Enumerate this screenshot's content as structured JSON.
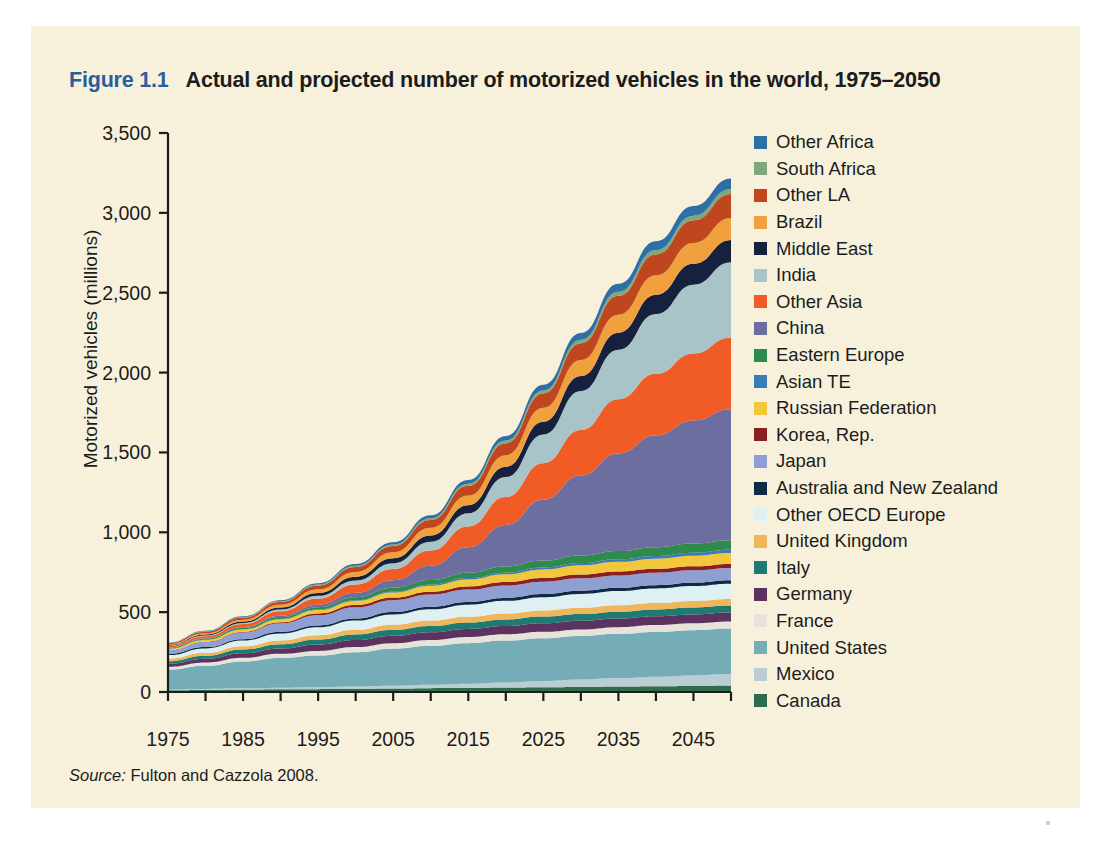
{
  "figure": {
    "number": "Figure 1.1",
    "title": "Actual and projected number of motorized vehicles in the world, 1975–2050",
    "source_word": "Source:",
    "source_text": "Fulton and Cazzola 2008.",
    "number_color": "#2a5d9e",
    "card_color": "#f7f1dc"
  },
  "chart_data": {
    "type": "area",
    "stacked": true,
    "title": "Actual and projected number of motorized vehicles in the world, 1975–2050",
    "xlabel": "",
    "ylabel": "Motorized vehicles (millions)",
    "xlim": [
      1975,
      2050
    ],
    "ylim": [
      0,
      3500
    ],
    "ytick_labels": [
      "0",
      "500",
      "1,000",
      "1,500",
      "2,000",
      "2,500",
      "3,000",
      "3,500"
    ],
    "ytick_values": [
      0,
      500,
      1000,
      1500,
      2000,
      2500,
      3000,
      3500
    ],
    "xtick_labels": [
      "1975",
      "1985",
      "1995",
      "2005",
      "2015",
      "2025",
      "2035",
      "2045"
    ],
    "xtick_values": [
      1975,
      1985,
      1995,
      2005,
      2015,
      2025,
      2035,
      2045
    ],
    "xminor_step": 5,
    "grid": false,
    "legend_position": "right",
    "x": [
      1975,
      1980,
      1985,
      1990,
      1995,
      2000,
      2005,
      2010,
      2015,
      2020,
      2025,
      2030,
      2035,
      2040,
      2045,
      2050
    ],
    "series": [
      {
        "name": "Canada",
        "color": "#2e6b4f",
        "values": [
          11,
          13,
          15,
          17,
          18,
          20,
          22,
          24,
          26,
          28,
          30,
          32,
          34,
          36,
          38,
          40
        ]
      },
      {
        "name": "Mexico",
        "color": "#b9cdd2",
        "values": [
          4,
          6,
          8,
          10,
          12,
          14,
          17,
          21,
          26,
          32,
          39,
          46,
          53,
          60,
          66,
          72
        ]
      },
      {
        "name": "United States",
        "color": "#74adb8",
        "values": [
          125,
          145,
          168,
          186,
          198,
          215,
          232,
          244,
          254,
          262,
          268,
          273,
          277,
          280,
          283,
          285
        ]
      },
      {
        "name": "France",
        "color": "#e7e3da",
        "values": [
          17,
          20,
          23,
          26,
          29,
          32,
          34,
          36,
          38,
          39,
          40,
          41,
          42,
          43,
          43,
          44
        ]
      },
      {
        "name": "Germany",
        "color": "#5c3260",
        "values": [
          20,
          24,
          29,
          33,
          40,
          44,
          47,
          49,
          51,
          52,
          53,
          54,
          54,
          55,
          55,
          56
        ]
      },
      {
        "name": "Italy",
        "color": "#1f7a73",
        "values": [
          16,
          19,
          23,
          27,
          32,
          35,
          37,
          39,
          40,
          41,
          42,
          42,
          43,
          43,
          44,
          44
        ]
      },
      {
        "name": "United Kingdom",
        "color": "#f0b65c",
        "values": [
          16,
          18,
          21,
          24,
          26,
          29,
          32,
          34,
          36,
          37,
          38,
          39,
          40,
          40,
          41,
          41
        ]
      },
      {
        "name": "Other OECD Europe",
        "color": "#dff0f3",
        "values": [
          22,
          28,
          35,
          43,
          50,
          58,
          65,
          71,
          76,
          80,
          84,
          87,
          89,
          91,
          93,
          95
        ]
      },
      {
        "name": "Australia and New Zealand",
        "color": "#0f2a44",
        "values": [
          7,
          8,
          9,
          11,
          12,
          13,
          15,
          16,
          17,
          18,
          19,
          20,
          20,
          21,
          21,
          22
        ]
      },
      {
        "name": "Japan",
        "color": "#8f9fd4",
        "values": [
          24,
          32,
          42,
          53,
          63,
          70,
          74,
          76,
          77,
          78,
          78,
          78,
          78,
          78,
          78,
          78
        ]
      },
      {
        "name": "Korea, Rep.",
        "color": "#8c1f1f",
        "values": [
          1,
          2,
          3,
          6,
          11,
          14,
          16,
          18,
          20,
          21,
          22,
          23,
          24,
          24,
          25,
          25
        ]
      },
      {
        "name": "Russian Federation",
        "color": "#f2c63d",
        "values": [
          8,
          11,
          15,
          19,
          22,
          26,
          32,
          38,
          44,
          49,
          54,
          58,
          61,
          64,
          66,
          68
        ]
      },
      {
        "name": "Asian TE",
        "color": "#3a7cb8",
        "values": [
          1,
          1,
          2,
          2,
          3,
          4,
          5,
          6,
          8,
          10,
          12,
          14,
          16,
          17,
          19,
          20
        ]
      },
      {
        "name": "Eastern Europe",
        "color": "#2f8a4e",
        "values": [
          5,
          7,
          9,
          12,
          15,
          19,
          24,
          29,
          34,
          39,
          44,
          48,
          52,
          55,
          58,
          60
        ]
      },
      {
        "name": "China",
        "color": "#6b6e9e",
        "values": [
          2,
          3,
          5,
          9,
          16,
          28,
          48,
          90,
          160,
          260,
          380,
          500,
          610,
          700,
          770,
          820
        ]
      },
      {
        "name": "Other Asia",
        "color": "#f15b25",
        "values": [
          8,
          12,
          18,
          27,
          38,
          52,
          70,
          95,
          130,
          175,
          230,
          285,
          340,
          385,
          420,
          450
        ]
      },
      {
        "name": "India",
        "color": "#a8c4c9",
        "values": [
          3,
          5,
          7,
          11,
          17,
          25,
          36,
          54,
          82,
          125,
          180,
          245,
          310,
          375,
          430,
          470
        ]
      },
      {
        "name": "Middle East",
        "color": "#16203f",
        "values": [
          4,
          6,
          9,
          13,
          18,
          24,
          31,
          40,
          51,
          64,
          79,
          93,
          107,
          120,
          131,
          140
        ]
      },
      {
        "name": "Brazil",
        "color": "#f0a03c",
        "values": [
          5,
          8,
          12,
          17,
          23,
          30,
          38,
          48,
          60,
          73,
          87,
          100,
          112,
          122,
          131,
          138
        ]
      },
      {
        "name": "Other LA",
        "color": "#c0461f",
        "values": [
          6,
          9,
          13,
          18,
          24,
          31,
          39,
          49,
          61,
          75,
          90,
          105,
          119,
          131,
          141,
          150
        ]
      },
      {
        "name": "South Africa",
        "color": "#7fa87a",
        "values": [
          2,
          3,
          4,
          5,
          6,
          7,
          9,
          11,
          13,
          16,
          19,
          22,
          25,
          27,
          29,
          31
        ]
      },
      {
        "name": "Other Africa",
        "color": "#2f6fa8",
        "values": [
          2,
          3,
          4,
          6,
          8,
          11,
          14,
          18,
          23,
          29,
          36,
          43,
          50,
          56,
          61,
          66
        ]
      }
    ]
  },
  "legend": {
    "items": [
      {
        "label": "Other Africa",
        "color": "#2f6fa8"
      },
      {
        "label": "South Africa",
        "color": "#7fa87a"
      },
      {
        "label": "Other LA",
        "color": "#c0461f"
      },
      {
        "label": "Brazil",
        "color": "#f0a03c"
      },
      {
        "label": "Middle East",
        "color": "#16203f"
      },
      {
        "label": "India",
        "color": "#a8c4c9"
      },
      {
        "label": "Other Asia",
        "color": "#f15b25"
      },
      {
        "label": "China",
        "color": "#6b6e9e"
      },
      {
        "label": "Eastern Europe",
        "color": "#2f8a4e"
      },
      {
        "label": "Asian TE",
        "color": "#3a7cb8"
      },
      {
        "label": "Russian Federation",
        "color": "#f2c63d"
      },
      {
        "label": "Korea, Rep.",
        "color": "#8c1f1f"
      },
      {
        "label": "Japan",
        "color": "#8f9fd4"
      },
      {
        "label": "Australia and New Zealand",
        "color": "#0f2a44"
      },
      {
        "label": "Other OECD Europe",
        "color": "#dff0f3"
      },
      {
        "label": "United Kingdom",
        "color": "#f0b65c"
      },
      {
        "label": "Italy",
        "color": "#1f7a73"
      },
      {
        "label": "Germany",
        "color": "#5c3260"
      },
      {
        "label": "France",
        "color": "#e7e3da"
      },
      {
        "label": "United States",
        "color": "#74adb8"
      },
      {
        "label": "Mexico",
        "color": "#b9cdd2"
      },
      {
        "label": "Canada",
        "color": "#2e6b4f"
      }
    ]
  }
}
